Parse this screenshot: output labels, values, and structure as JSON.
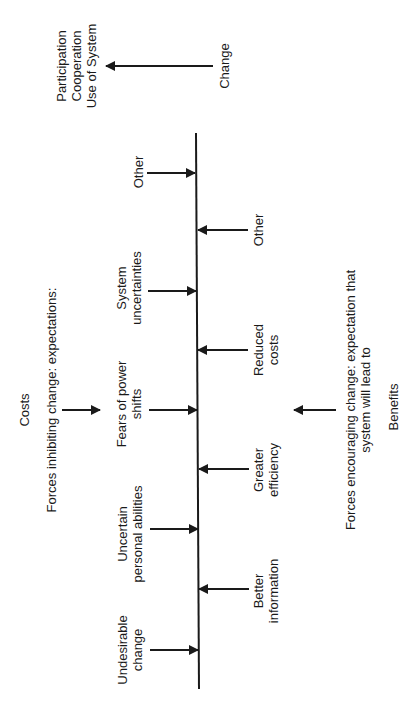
{
  "diagram": {
    "type": "force-field-analysis",
    "orientation": "rotated-90-ccw",
    "change": {
      "label": "Change",
      "outcome_lines": [
        "Participation",
        "Cooperation",
        "Use of System"
      ]
    },
    "restraining": {
      "header": "Costs",
      "title": "Forces inhibiting change: expectations:",
      "forces": [
        {
          "lines": [
            "Other"
          ]
        },
        {
          "lines": [
            "System",
            "uncertainties"
          ]
        },
        {
          "lines": [
            "Fears of  power",
            "shifts"
          ]
        },
        {
          "lines": [
            "Uncertain",
            "personal  abilities"
          ]
        },
        {
          "lines": [
            "Undesirable",
            "change"
          ]
        }
      ]
    },
    "driving": {
      "title_lines": [
        "Forces encouraging change: expectation that",
        "system will lead to"
      ],
      "footer": "Benefits",
      "forces": [
        {
          "lines": [
            "Other"
          ]
        },
        {
          "lines": [
            "Reduced",
            "costs"
          ]
        },
        {
          "lines": [
            "Greater",
            "efficiency"
          ]
        },
        {
          "lines": [
            "Better",
            "information"
          ]
        }
      ]
    },
    "colors": {
      "ink": "#1a1a1a",
      "background": "#ffffff"
    }
  }
}
